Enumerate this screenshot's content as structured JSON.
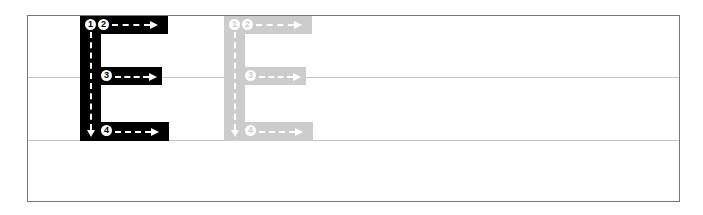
{
  "worksheet": {
    "letter": "E",
    "colors": {
      "model_letter": "#000000",
      "trace_letter": "#cccccc",
      "border": "#777777",
      "guideline": "#c4c4c4",
      "stroke_marks": "#ffffff"
    },
    "model": {
      "strokes": [
        {
          "num": "1",
          "direction": "down"
        },
        {
          "num": "2",
          "direction": "right"
        },
        {
          "num": "3",
          "direction": "right"
        },
        {
          "num": "4",
          "direction": "right"
        }
      ]
    },
    "trace": {
      "strokes": [
        {
          "num": "1",
          "direction": "down"
        },
        {
          "num": "2",
          "direction": "right"
        },
        {
          "num": "3",
          "direction": "right"
        },
        {
          "num": "4",
          "direction": "right"
        }
      ]
    }
  }
}
